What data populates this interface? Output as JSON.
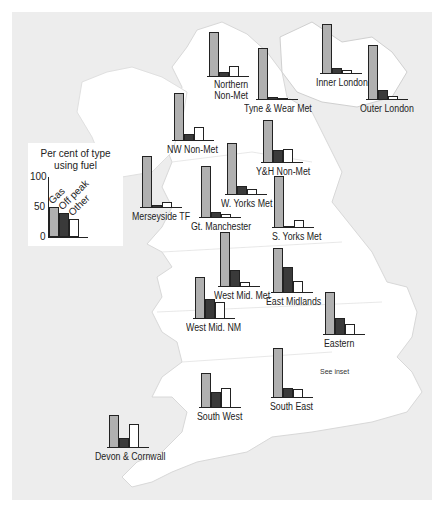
{
  "chart_data": {
    "type": "bar",
    "title": "Per cent of type using fuel",
    "subtitle": "",
    "xlabel": "",
    "ylabel": "Per cent of type using fuel",
    "ylim": [
      0,
      100
    ],
    "yticks": [
      0,
      50,
      100
    ],
    "grid": false,
    "legend_position": "left, inset box",
    "categories": [
      "Gas",
      "Off peak",
      "Other"
    ],
    "series_colors": {
      "Gas": "#b0b0b0",
      "Off peak": "#3a3a3a",
      "Other": "#ffffff"
    },
    "legend_example": {
      "Gas": 50,
      "Off peak": 40,
      "Other": 30
    },
    "regions": [
      {
        "name": "Northern Non-Met",
        "values": [
          76,
          8,
          19
        ]
      },
      {
        "name": "Tyne & Wear Met",
        "values": [
          88,
          5,
          3
        ]
      },
      {
        "name": "Inner London",
        "values": [
          85,
          10,
          7
        ]
      },
      {
        "name": "Outer London",
        "values": [
          93,
          17,
          7
        ]
      },
      {
        "name": "NW Non-Met",
        "values": [
          81,
          12,
          24
        ]
      },
      {
        "name": "Y&H Non-Met",
        "values": [
          73,
          22,
          24
        ]
      },
      {
        "name": "Merseyside TF",
        "values": [
          88,
          5,
          10
        ]
      },
      {
        "name": "W. Yorks Met",
        "values": [
          88,
          15,
          10
        ]
      },
      {
        "name": "Gt. Manchester",
        "values": [
          88,
          10,
          7
        ]
      },
      {
        "name": "S. Yorks Met",
        "values": [
          88,
          2,
          14
        ]
      },
      {
        "name": "West Mid. Met",
        "values": [
          93,
          29,
          8
        ]
      },
      {
        "name": "East Midlands",
        "values": [
          76,
          44,
          20
        ]
      },
      {
        "name": "West Mid. NM",
        "values": [
          71,
          34,
          29
        ]
      },
      {
        "name": "Eastern",
        "values": [
          73,
          29,
          19
        ]
      },
      {
        "name": "South East",
        "values": [
          85,
          17,
          15
        ]
      },
      {
        "name": "South West",
        "values": [
          59,
          27,
          34
        ]
      },
      {
        "name": "Devon & Cornwall",
        "values": [
          56,
          17,
          41
        ]
      }
    ],
    "annotations": [
      "See inset"
    ]
  },
  "legend": {
    "title_line1": "Per cent of type",
    "title_line2": "using fuel",
    "tick_100": "100",
    "tick_50": "50",
    "tick_0": "0",
    "labels": [
      "Gas",
      "Off peak",
      "Other"
    ]
  },
  "labels": {
    "northern_1": "Northern",
    "northern_2": "Non-Met",
    "tyne": "Tyne & Wear Met",
    "inner_london": "Inner London",
    "outer_london": "Outer London",
    "nw": "NW Non-Met",
    "yh": "Y&H Non-Met",
    "merseyside": "Merseyside TF",
    "wyorks": "W. Yorks Met",
    "gtman": "Gt. Manchester",
    "syorks": "S. Yorks Met",
    "wmm": "West Mid. Met",
    "em": "East Midlands",
    "wmnm": "West Mid. NM",
    "eastern": "Eastern",
    "se": "South East",
    "sw": "South West",
    "dc": "Devon & Cornwall",
    "inset": "See inset"
  }
}
